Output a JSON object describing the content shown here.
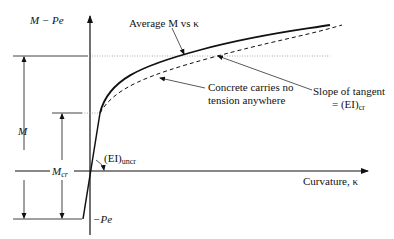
{
  "diagram": {
    "y_axis_label": "M − Pe",
    "x_axis_label": "Curvature, κ",
    "curves": {
      "average": "Average M vs κ",
      "no_tension_line1": "Concrete carries no",
      "no_tension_line2": "tension anywhere"
    },
    "tangent_label_line1": "Slope of tangent",
    "tangent_label_line2": "= (EI)",
    "tangent_label_sub": "cr",
    "uncracked_label": "(EI)",
    "uncracked_sub": "uncr",
    "dimension_M": "M",
    "dimension_Mcr": "M",
    "dimension_Mcr_sub": "cr",
    "neg_Pe": "−Pe",
    "colors": {
      "line": "#111111",
      "guide": "#888888"
    }
  }
}
